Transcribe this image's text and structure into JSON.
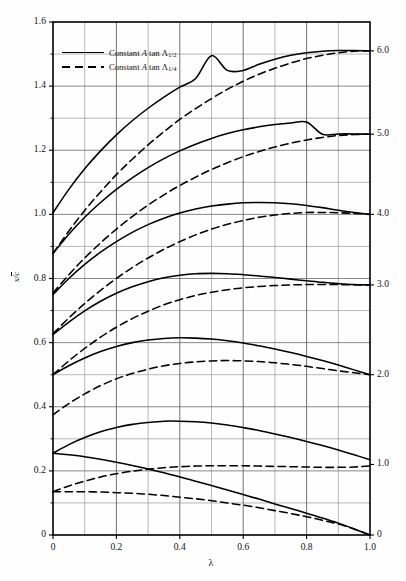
{
  "chart_data": {
    "type": "line",
    "title": "",
    "xlabel": "λ",
    "ylabel": "x/c̄",
    "xlim": [
      0,
      1.0
    ],
    "ylim": [
      0,
      1.6
    ],
    "grid": true,
    "x_major_ticks": [
      0,
      0.2,
      0.4,
      0.6,
      0.8,
      1.0
    ],
    "x_major_tick_labels": [
      "0",
      "0.2",
      "0.4",
      "0.6",
      "0.8",
      "1.0"
    ],
    "x_minor_ticks": [
      0.1,
      0.3,
      0.5,
      0.7,
      0.9
    ],
    "y_major_ticks": [
      0,
      0.2,
      0.4,
      0.6,
      0.8,
      1.0,
      1.2,
      1.4,
      1.6
    ],
    "y_major_tick_labels": [
      "0",
      "0.2",
      "0.4",
      "0.6",
      "0.8",
      "1.0",
      "1.2",
      "1.4",
      "1.6"
    ],
    "y_minor_ticks": [
      0.1,
      0.3,
      0.5,
      0.7,
      0.9,
      1.1,
      1.3,
      1.5
    ],
    "right_axis_labels": [
      "6.0",
      "5.0",
      "4.0",
      "3.0",
      "2.0",
      "1.0",
      "0"
    ],
    "right_axis_values": [
      1.51,
      1.25,
      1.0,
      0.78,
      0.5,
      0.22,
      0.0
    ],
    "legend_position": "upper-left",
    "x": [
      0,
      0.05,
      0.1,
      0.15,
      0.2,
      0.25,
      0.3,
      0.35,
      0.4,
      0.45,
      0.5,
      0.55,
      0.6,
      0.65,
      0.7,
      0.75,
      0.8,
      0.85,
      0.9,
      0.95,
      1.0
    ],
    "series": [
      {
        "name": "A tan Λ1/2 = 6.0",
        "style": "solid",
        "parameter": "6.0",
        "values": [
          1.005,
          1.078,
          1.142,
          1.198,
          1.248,
          1.292,
          1.331,
          1.366,
          1.397,
          1.424,
          1.495,
          1.449,
          1.449,
          1.468,
          1.484,
          1.496,
          1.504,
          1.509,
          1.511,
          1.511,
          1.51
        ]
      },
      {
        "name": "A tan Λ1/4 = 6.0",
        "style": "dashed",
        "parameter": "6.0",
        "values": [
          0.878,
          0.948,
          1.012,
          1.07,
          1.124,
          1.172,
          1.217,
          1.258,
          1.296,
          1.33,
          1.361,
          1.39,
          1.415,
          1.437,
          1.456,
          1.472,
          1.486,
          1.496,
          1.504,
          1.509,
          1.51
        ]
      },
      {
        "name": "A tan Λ1/2 = 5.0",
        "style": "solid",
        "parameter": "5.0",
        "values": [
          0.878,
          0.938,
          0.991,
          1.037,
          1.078,
          1.114,
          1.146,
          1.174,
          1.198,
          1.219,
          1.237,
          1.252,
          1.264,
          1.273,
          1.28,
          1.285,
          1.288,
          1.25,
          1.251,
          1.251,
          1.25
        ]
      },
      {
        "name": "A tan Λ1/4 = 5.0",
        "style": "dashed",
        "parameter": "5.0",
        "values": [
          0.755,
          0.812,
          0.864,
          0.911,
          0.954,
          0.993,
          1.029,
          1.061,
          1.09,
          1.116,
          1.14,
          1.161,
          1.18,
          1.196,
          1.21,
          1.222,
          1.232,
          1.24,
          1.246,
          1.249,
          1.25
        ]
      },
      {
        "name": "A tan Λ1/2 = 4.0",
        "style": "solid",
        "parameter": "4.0",
        "values": [
          0.75,
          0.8,
          0.844,
          0.882,
          0.915,
          0.944,
          0.968,
          0.988,
          1.004,
          1.017,
          1.026,
          1.032,
          1.036,
          1.037,
          1.036,
          1.033,
          1.028,
          1.021,
          1.013,
          1.006,
          1.0
        ]
      },
      {
        "name": "A tan Λ1/4 = 4.0",
        "style": "dashed",
        "parameter": "4.0",
        "values": [
          0.628,
          0.677,
          0.722,
          0.763,
          0.8,
          0.834,
          0.864,
          0.891,
          0.915,
          0.936,
          0.954,
          0.969,
          0.981,
          0.991,
          0.998,
          1.003,
          1.006,
          1.006,
          1.005,
          1.003,
          1.0
        ]
      },
      {
        "name": "A tan Λ1/2 = 3.0",
        "style": "solid",
        "parameter": "3.0",
        "values": [
          0.625,
          0.664,
          0.699,
          0.729,
          0.754,
          0.774,
          0.79,
          0.802,
          0.81,
          0.815,
          0.816,
          0.815,
          0.812,
          0.808,
          0.803,
          0.798,
          0.793,
          0.788,
          0.784,
          0.781,
          0.78
        ]
      },
      {
        "name": "A tan Λ1/4 = 3.0",
        "style": "dashed",
        "parameter": "3.0",
        "values": [
          0.5,
          0.543,
          0.582,
          0.617,
          0.648,
          0.675,
          0.698,
          0.718,
          0.734,
          0.747,
          0.757,
          0.765,
          0.771,
          0.775,
          0.778,
          0.78,
          0.781,
          0.781,
          0.781,
          0.78,
          0.78
        ]
      },
      {
        "name": "A tan Λ1/2 = 2.0",
        "style": "solid",
        "parameter": "2.0",
        "values": [
          0.5,
          0.528,
          0.552,
          0.572,
          0.588,
          0.6,
          0.608,
          0.613,
          0.615,
          0.614,
          0.611,
          0.606,
          0.599,
          0.59,
          0.58,
          0.569,
          0.557,
          0.544,
          0.53,
          0.515,
          0.5
        ]
      },
      {
        "name": "A tan Λ1/4 = 2.0",
        "style": "dashed",
        "parameter": "2.0",
        "values": [
          0.375,
          0.41,
          0.44,
          0.466,
          0.487,
          0.504,
          0.517,
          0.528,
          0.535,
          0.54,
          0.543,
          0.544,
          0.543,
          0.541,
          0.537,
          0.532,
          0.526,
          0.519,
          0.512,
          0.506,
          0.5
        ]
      },
      {
        "name": "A tan Λ1/2 = 1.0",
        "style": "solid",
        "parameter": "1.0",
        "values": [
          0.255,
          0.282,
          0.304,
          0.322,
          0.335,
          0.345,
          0.351,
          0.355,
          0.355,
          0.353,
          0.349,
          0.343,
          0.335,
          0.326,
          0.315,
          0.304,
          0.292,
          0.279,
          0.265,
          0.25,
          0.235
        ]
      },
      {
        "name": "A tan Λ1/4 = 1.0",
        "style": "dashed",
        "parameter": "1.0",
        "values": [
          0.135,
          0.153,
          0.168,
          0.181,
          0.191,
          0.199,
          0.205,
          0.21,
          0.213,
          0.215,
          0.216,
          0.216,
          0.216,
          0.215,
          0.214,
          0.213,
          0.212,
          0.211,
          0.211,
          0.212,
          0.215
        ]
      },
      {
        "name": "A tan Λ1/2 = 0",
        "style": "solid",
        "parameter": "0",
        "values": [
          0.255,
          0.25,
          0.244,
          0.236,
          0.227,
          0.217,
          0.206,
          0.194,
          0.181,
          0.168,
          0.154,
          0.14,
          0.126,
          0.112,
          0.097,
          0.083,
          0.068,
          0.053,
          0.037,
          0.019,
          0.0
        ]
      },
      {
        "name": "A tan Λ1/4 = 0",
        "style": "dashed",
        "parameter": "0",
        "values": [
          0.135,
          0.135,
          0.135,
          0.134,
          0.132,
          0.13,
          0.127,
          0.123,
          0.118,
          0.113,
          0.107,
          0.1,
          0.093,
          0.085,
          0.076,
          0.067,
          0.057,
          0.046,
          0.034,
          0.019,
          0.0
        ]
      }
    ],
    "legend": [
      {
        "label_prefix": "Constant ",
        "label_italic": "A",
        "label_mid": " tan ",
        "label_lambda": "Λ",
        "label_sub": "1/2",
        "style": "solid"
      },
      {
        "label_prefix": "Constant ",
        "label_italic": "A",
        "label_mid": " tan ",
        "label_lambda": "Λ",
        "label_sub": "1/4",
        "style": "dashed"
      }
    ]
  },
  "axes": {
    "x_title": "λ",
    "y_title": "x/c̄"
  }
}
